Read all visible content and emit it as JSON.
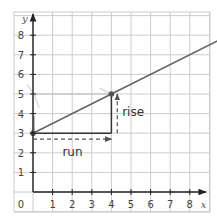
{
  "chart_data": {
    "type": "line",
    "title": "",
    "xlabel": "x",
    "ylabel": "y",
    "xlim": [
      0,
      9.5
    ],
    "ylim": [
      0,
      8.5
    ],
    "grid": true,
    "x_ticks": [
      "1",
      "2",
      "3",
      "4",
      "5",
      "6",
      "7",
      "8"
    ],
    "y_ticks": [
      "1",
      "2",
      "3",
      "4",
      "5",
      "6",
      "7",
      "8"
    ],
    "origin_label": "0",
    "series": [
      {
        "name": "line",
        "equation": "y = 0.5x + 3",
        "x": [
          0,
          4,
          9.5
        ],
        "y": [
          3,
          5,
          7.75
        ],
        "color": "#666666"
      }
    ],
    "points": [
      {
        "x": 0,
        "y": 3
      },
      {
        "x": 4,
        "y": 5
      }
    ],
    "annotations": [
      {
        "text": "run",
        "from": [
          0,
          2.7
        ],
        "to": [
          4,
          2.7
        ],
        "style": "dashed-arrow",
        "value": 4
      },
      {
        "text": "rise",
        "from": [
          4.3,
          3
        ],
        "to": [
          4.3,
          5
        ],
        "style": "dashed-arrow",
        "value": 2
      }
    ],
    "colors": {
      "grid": "#cccccc",
      "axis": "#222222",
      "line": "#666666",
      "guide": "#bbbbbb"
    }
  }
}
